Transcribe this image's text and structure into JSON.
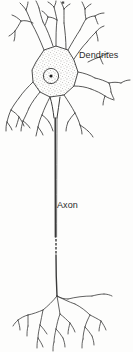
{
  "figure": {
    "background_color": "#fdfdfc",
    "ink_color": "#2b2b2b",
    "width": 133,
    "height": 352
  },
  "labels": {
    "dendrites": "Dendrites",
    "axon": "Axon"
  },
  "parts": {
    "soma_name": "soma-cell-body",
    "nucleus_name": "nucleus",
    "nucleolus_name": "nucleolus",
    "dendrite_tree_name": "dendrite-tree",
    "axon_name": "axon",
    "axon_break_name": "axon-interruption-dashes",
    "terminals_name": "axon-terminal-arborization"
  }
}
